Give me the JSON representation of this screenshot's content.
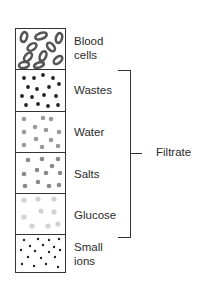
{
  "diagram": {
    "sections": [
      {
        "label": "Blood cells",
        "label_lines": [
          "Blood",
          "cells"
        ],
        "pattern": "oval-cells",
        "color": "#555555"
      },
      {
        "label": "Wastes",
        "pattern": "dark-dots",
        "color": "#222222"
      },
      {
        "label": "Water",
        "pattern": "grey-dots",
        "color": "#9a9a9a"
      },
      {
        "label": "Salts",
        "pattern": "grey-dots",
        "color": "#8a8a8a"
      },
      {
        "label": "Glucose",
        "pattern": "light-dots",
        "color": "#d0d0d0"
      },
      {
        "label": "Small ions",
        "label_lines": [
          "Small",
          "ions"
        ],
        "pattern": "tiny-dots",
        "color": "#222222"
      }
    ],
    "bracket": {
      "label": "Filtrate",
      "spans": [
        "Wastes",
        "Water",
        "Salts",
        "Glucose"
      ]
    }
  }
}
